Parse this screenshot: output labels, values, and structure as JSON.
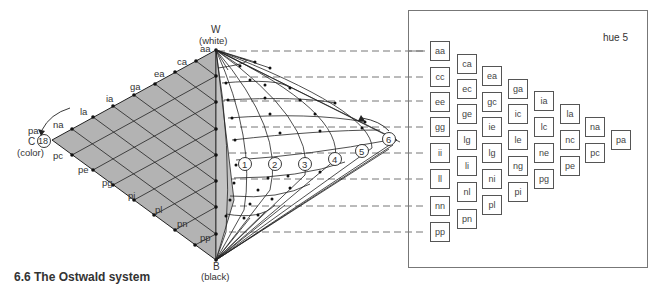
{
  "figure": {
    "caption": "6.6 The Ostwald system",
    "panel_title": "hue 5"
  },
  "triangle": {
    "apex_white": {
      "letter": "W",
      "desc": "(white)"
    },
    "apex_black": {
      "letter": "B",
      "desc": "(black)"
    },
    "apex_color": {
      "letter": "C",
      "desc": "(color)",
      "hue_number": "18"
    },
    "upper_edge_labels": [
      "aa",
      "ca",
      "ea",
      "ga",
      "ia",
      "la",
      "na",
      "pa"
    ],
    "lower_edge_labels": [
      "pc",
      "pe",
      "pg",
      "pi",
      "pl",
      "pn",
      "pp"
    ],
    "fill_color": "#b3b3b3"
  },
  "hue_circles": [
    "1",
    "2",
    "3",
    "4",
    "5",
    "6"
  ],
  "swatch_columns": [
    [
      "aa",
      "cc",
      "ee",
      "gg",
      "ii",
      "ll",
      "nn",
      "pp"
    ],
    [
      "ca",
      "ec",
      "ge",
      "lg",
      "li",
      "nl",
      "pn"
    ],
    [
      "ea",
      "gc",
      "ie",
      "lg",
      "ni",
      "pl"
    ],
    [
      "ga",
      "ic",
      "le",
      "ng",
      "pi"
    ],
    [
      "ia",
      "lc",
      "ne",
      "pg"
    ],
    [
      "la",
      "nc",
      "pe"
    ],
    [
      "na",
      "pc"
    ],
    [
      "pa"
    ]
  ]
}
